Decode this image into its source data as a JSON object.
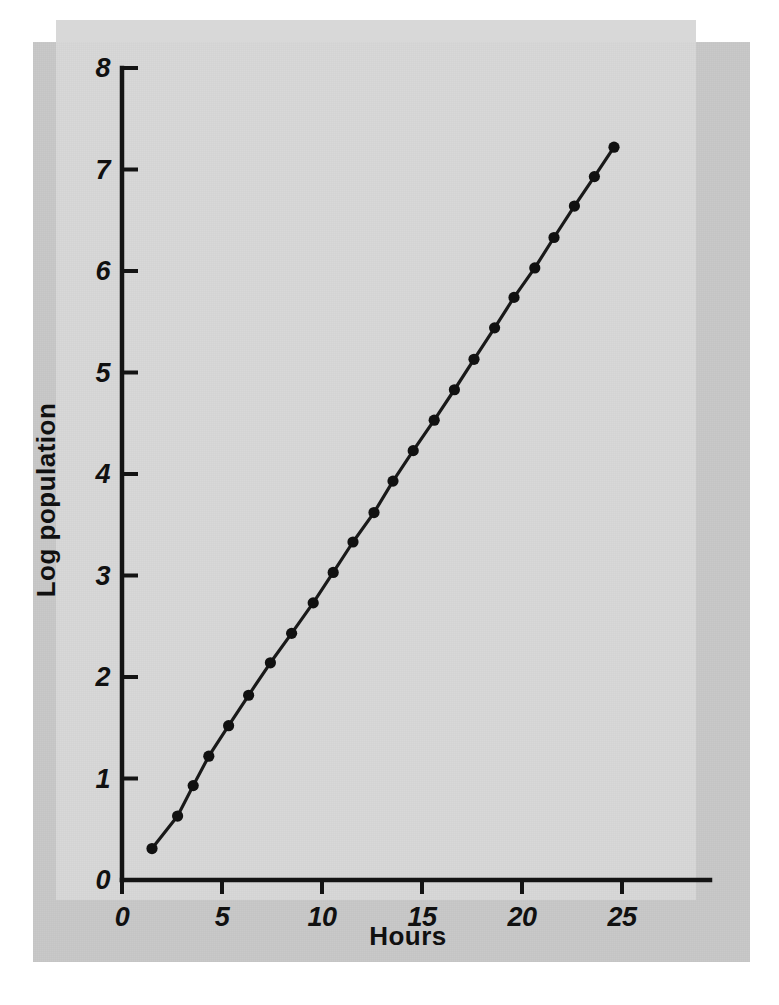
{
  "chart_data": {
    "type": "line",
    "title": "",
    "xlabel": "Hours",
    "ylabel": "Log population",
    "xlim": [
      0,
      26.5
    ],
    "ylim": [
      0,
      8
    ],
    "xticks": [
      0,
      5,
      10,
      15,
      20,
      25
    ],
    "xtick_labels": [
      "0",
      "5",
      "10",
      "15",
      "20",
      "25"
    ],
    "yticks": [
      0,
      1,
      2,
      3,
      4,
      5,
      6,
      7,
      8
    ],
    "ytick_labels": [
      "0",
      "1",
      "2",
      "3",
      "4",
      "5",
      "6",
      "7",
      "8"
    ],
    "grid": false,
    "legend": false,
    "legend_position": "none",
    "marker": "filled-circle",
    "line_color": "#1a1a1a",
    "marker_color": "#111111",
    "background_color": "#d8d8d8",
    "mount_color": "#c9c9c9",
    "series": [
      {
        "name": "Log population",
        "x": [
          1.5,
          2.78,
          3.56,
          4.34,
          5.33,
          6.33,
          7.42,
          8.48,
          9.56,
          10.56,
          11.55,
          12.6,
          13.55,
          14.56,
          15.61,
          16.62,
          17.6,
          18.63,
          19.6,
          20.64,
          21.6,
          22.62,
          23.62,
          24.6
        ],
        "y": [
          0.31,
          0.63,
          0.93,
          1.22,
          1.52,
          1.82,
          2.14,
          2.43,
          2.73,
          3.03,
          3.33,
          3.62,
          3.93,
          4.23,
          4.53,
          4.83,
          5.13,
          5.44,
          5.74,
          6.03,
          6.33,
          6.64,
          6.93,
          7.22
        ]
      }
    ],
    "annotations": []
  }
}
